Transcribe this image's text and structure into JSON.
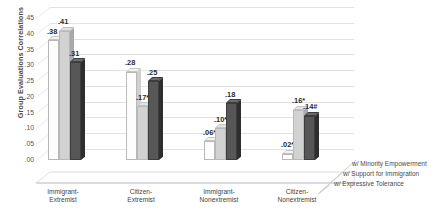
{
  "chart_data": {
    "type": "bar",
    "title": "",
    "subtitle": "",
    "xlabel": "",
    "ylabel": "Group Evaluations Correlations",
    "ylim": [
      0.0,
      0.45
    ],
    "ytick_labels": [
      ".45",
      ".40",
      ".35",
      ".30",
      ".25",
      ".20",
      ".15",
      ".10",
      ".05",
      ".00"
    ],
    "ytick_values": [
      0.45,
      0.4,
      0.35,
      0.3,
      0.25,
      0.2,
      0.15,
      0.1,
      0.05,
      0.0
    ],
    "grid": true,
    "legend_position": "right-bottom",
    "categories": [
      "Immigrant-Extremist",
      "Citizen-Extremist",
      "Immigrant-Nonextremist",
      "Citizen-Nonextremist"
    ],
    "category_lines": [
      [
        "Immigrant-",
        "Extremist"
      ],
      [
        "Citizen-",
        "Extremist"
      ],
      [
        "Immigrant-",
        "Nonextremist"
      ],
      [
        "Citizen-",
        "Nonextremist"
      ]
    ],
    "series": [
      {
        "name": "w/ Expressive Tolerance",
        "color": "#fdfdfd",
        "values": [
          0.38,
          0.28,
          0.06,
          0.02
        ],
        "labels": [
          ".38",
          ".28",
          ".06**",
          ".02***"
        ]
      },
      {
        "name": "w/ Support for Immigration",
        "color": "#d2d2d2",
        "values": [
          0.41,
          0.17,
          0.1,
          0.16
        ],
        "labels": [
          ".41",
          ".17*",
          ".10**",
          ".16*"
        ]
      },
      {
        "name": "w/ Minority Empowerment",
        "color": "#575757",
        "values": [
          0.31,
          0.25,
          0.18,
          0.14
        ],
        "labels": [
          ".31",
          ".25",
          ".18",
          ".14#"
        ]
      }
    ]
  },
  "legend": {
    "items": [
      "w/ Minority Empowerment",
      "w/ Support for Immigration",
      "w/ Expressive Tolerance"
    ]
  },
  "axis": {
    "y_title": "Group Evaluations Correlations"
  }
}
